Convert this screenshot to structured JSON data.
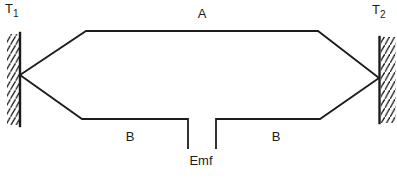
{
  "diagram": {
    "title_semantic": "thermocouple-circuit",
    "junction_left": {
      "label": "T",
      "sub": "1"
    },
    "junction_right": {
      "label": "T",
      "sub": "2"
    },
    "wire_top_label": "A",
    "wire_bottom_left_label": "B",
    "wire_bottom_right_label": "B",
    "emf_label": "Emf",
    "line_color": "#1c1c1c",
    "background_color": "#ffffff"
  }
}
